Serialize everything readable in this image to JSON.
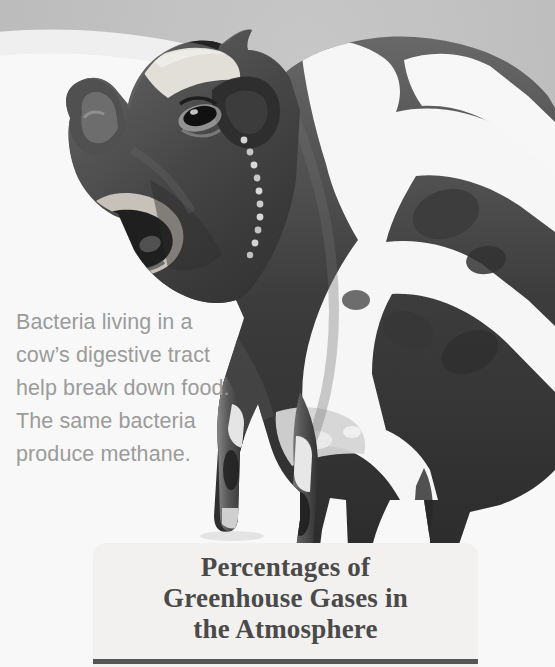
{
  "page": {
    "width": 555,
    "height": 667,
    "background_color": "#ffffff",
    "backdrop_gray": "#bfbfbf"
  },
  "photo": {
    "subject": "cow-photograph",
    "description": "Black and white photograph of a dairy cow standing, head turned toward viewer",
    "style": "grayscale",
    "backdrop_color": "#bfbfbf"
  },
  "cow_caption": {
    "text": "Bacteria living in a\ncow’s digestive tract\nhelp break down food.\nThe same bacteria\nproduce methane.",
    "color": "#9b9b9b",
    "lines": [
      "Bacteria living in a",
      "cow’s digestive tract",
      "help break down food.",
      "The same bacteria",
      "produce methane."
    ]
  },
  "title_panel": {
    "background_color": "#f2f1ef",
    "title": "Percentages of\nGreenhouse Gases in\nthe Atmosphere",
    "title_lines": [
      "Percentages of",
      "Greenhouse Gases in",
      "the Atmosphere"
    ],
    "title_color": "#4a4a4a",
    "rule_color": "#555555"
  }
}
